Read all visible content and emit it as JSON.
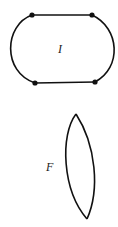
{
  "figure": {
    "shapes": [
      {
        "id": "I",
        "label": "I",
        "type": "closed curve with two straight edges and four marked vertices"
      },
      {
        "id": "F",
        "label": "F",
        "type": "lens-shaped closed curve with two cusps"
      }
    ],
    "stroke_color": "#111111",
    "background": "#ffffff"
  }
}
